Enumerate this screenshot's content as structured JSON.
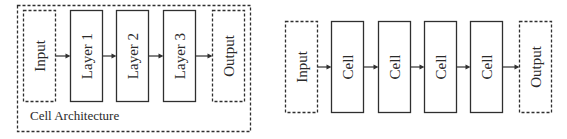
{
  "left_diagram": {
    "caption": "Cell Architecture",
    "nodes": [
      {
        "label": "Input",
        "style": "dashed"
      },
      {
        "label": "Layer 1",
        "style": "solid"
      },
      {
        "label": "Layer 2",
        "style": "solid"
      },
      {
        "label": "Layer 3",
        "style": "solid"
      },
      {
        "label": "Output",
        "style": "dashed"
      }
    ]
  },
  "right_diagram": {
    "nodes": [
      {
        "label": "Input",
        "style": "dashed"
      },
      {
        "label": "Cell",
        "style": "solid"
      },
      {
        "label": "Cell",
        "style": "solid"
      },
      {
        "label": "Cell",
        "style": "solid"
      },
      {
        "label": "Cell",
        "style": "solid"
      },
      {
        "label": "Output",
        "style": "dashed"
      }
    ]
  }
}
